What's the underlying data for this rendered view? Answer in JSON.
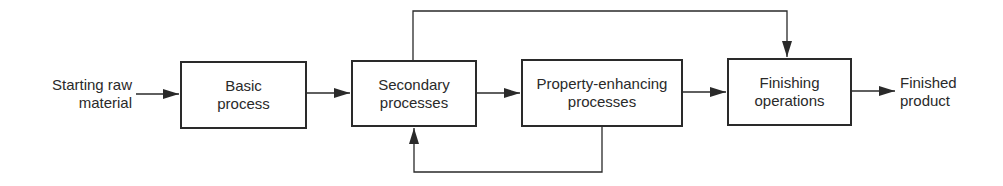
{
  "diagram": {
    "type": "process-flowchart",
    "input_label": [
      "Starting raw",
      "material"
    ],
    "output_label": [
      "Finished",
      "product"
    ],
    "nodes": [
      {
        "id": "basic",
        "lines": [
          "Basic",
          "process"
        ]
      },
      {
        "id": "secondary",
        "lines": [
          "Secondary",
          "processes"
        ]
      },
      {
        "id": "property",
        "lines": [
          "Property-enhancing",
          "processes"
        ]
      },
      {
        "id": "finishing",
        "lines": [
          "Finishing",
          "operations"
        ]
      }
    ],
    "edges": [
      {
        "from": "input",
        "to": "basic"
      },
      {
        "from": "basic",
        "to": "secondary"
      },
      {
        "from": "secondary",
        "to": "property"
      },
      {
        "from": "property",
        "to": "finishing"
      },
      {
        "from": "finishing",
        "to": "output"
      },
      {
        "from": "secondary",
        "to": "finishing",
        "route": "top-bypass"
      },
      {
        "from": "property",
        "to": "secondary",
        "route": "bottom-feedback"
      }
    ],
    "colors": {
      "stroke": "#2a2a2a",
      "background": "#ffffff"
    }
  }
}
